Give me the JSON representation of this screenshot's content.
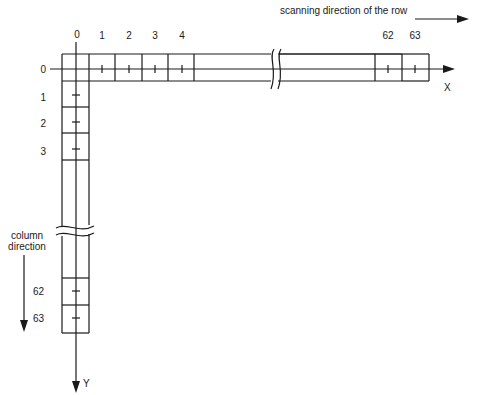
{
  "diagram": {
    "title": "scanning direction of the row",
    "column_direction_label": [
      "column",
      "direction"
    ],
    "x_axis_label": "X",
    "y_axis_label": "Y",
    "origin_label_top": "0",
    "origin_label_left": "0",
    "row_cell_labels": [
      "1",
      "2",
      "3",
      "4",
      "62",
      "63"
    ],
    "column_cell_labels": [
      "1",
      "2",
      "3",
      "62",
      "63"
    ],
    "stroke_color": "#1a1a1a",
    "background_color": "#ffffff"
  }
}
